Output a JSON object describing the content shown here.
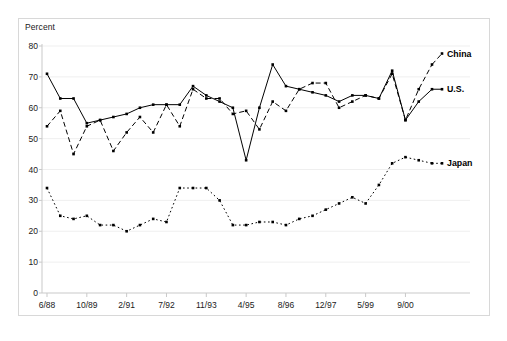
{
  "chart": {
    "ylabel": "Percent",
    "frame_color": "#d8d8d8",
    "axis_color": "#c9c9c9",
    "grid_color": "#efefef",
    "series_color": "#000000"
  },
  "chart_data": {
    "type": "line",
    "title": "",
    "xlabel": "",
    "ylabel": "Percent",
    "ylim": [
      0,
      80
    ],
    "ytick_values": [
      0,
      10,
      20,
      30,
      40,
      50,
      60,
      70,
      80
    ],
    "grid": true,
    "legend": "right-inline-labels",
    "xtick_labels": [
      "6/88",
      "10/89",
      "2/91",
      "7/92",
      "11/93",
      "4/95",
      "8/96",
      "12/97",
      "5/99",
      "9/00"
    ],
    "xtick_indices": [
      0,
      3,
      6,
      9,
      12,
      15,
      18,
      21,
      24,
      27
    ],
    "n_points": 30,
    "series": [
      {
        "name": "U.S.",
        "style": "solid",
        "label": "U.S.",
        "values": [
          71,
          63,
          63,
          55,
          56,
          57,
          58,
          60,
          61,
          61,
          61,
          67,
          64,
          62,
          60,
          43,
          60,
          74,
          67,
          66,
          65,
          64,
          62,
          64,
          64,
          63,
          72,
          56,
          62,
          66
        ]
      },
      {
        "name": "China",
        "style": "dashed",
        "label": "China",
        "values": [
          54,
          59,
          45,
          54,
          56,
          46,
          52,
          57,
          52,
          61,
          54,
          66,
          63,
          63,
          58,
          59,
          53,
          62,
          59,
          66,
          68,
          68,
          60,
          62,
          64,
          63,
          71,
          56,
          66,
          74
        ]
      },
      {
        "name": "Japan",
        "style": "dotted",
        "label": "Japan",
        "values": [
          34,
          25,
          24,
          25,
          22,
          22,
          20,
          22,
          24,
          23,
          34,
          34,
          34,
          30,
          22,
          22,
          23,
          23,
          22,
          24,
          25,
          27,
          29,
          31,
          29,
          35,
          42,
          44,
          43,
          42
        ]
      }
    ]
  }
}
